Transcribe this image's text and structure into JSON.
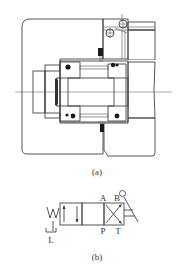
{
  "figure": {
    "part_a": {
      "caption": "(a)",
      "description": "Sectional view of a rotary valve assembly with hatched housing, spool/shaft, O-ring seals and ball detents"
    },
    "part_b": {
      "caption": "(b)",
      "description": "Hydraulic symbol of a 4-port 2-position directional valve with spring return and lever actuation",
      "ports": {
        "a": "A",
        "b": "B",
        "p": "P",
        "t": "T",
        "l": "L"
      }
    }
  },
  "colors": {
    "line": "#444444",
    "hatch": "#666666",
    "seal": "#1a1a1a",
    "background": "#ffffff"
  }
}
